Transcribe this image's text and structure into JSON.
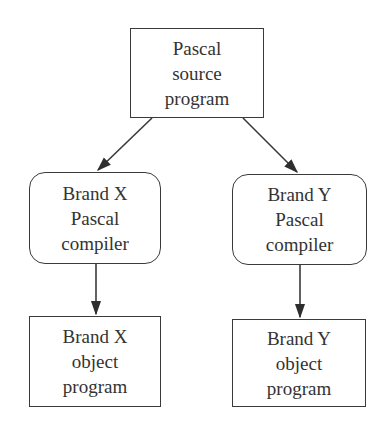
{
  "diagram": {
    "nodes": [
      {
        "id": "source",
        "shape": "rectangle",
        "lines": [
          "Pascal",
          "source",
          "program"
        ]
      },
      {
        "id": "compiler_x",
        "shape": "rounded-rectangle",
        "lines": [
          "Brand X",
          "Pascal",
          "compiler"
        ]
      },
      {
        "id": "compiler_y",
        "shape": "rounded-rectangle",
        "lines": [
          "Brand Y",
          "Pascal",
          "compiler"
        ]
      },
      {
        "id": "object_x",
        "shape": "rectangle",
        "lines": [
          "Brand X",
          "object",
          "program"
        ]
      },
      {
        "id": "object_y",
        "shape": "rectangle",
        "lines": [
          "Brand Y",
          "object",
          "program"
        ]
      }
    ],
    "edges": [
      {
        "from": "source",
        "to": "compiler_x"
      },
      {
        "from": "source",
        "to": "compiler_y"
      },
      {
        "from": "compiler_x",
        "to": "object_x"
      },
      {
        "from": "compiler_y",
        "to": "object_y"
      }
    ],
    "colors": {
      "stroke": "#3a3a3a",
      "text": "#333333",
      "background": "#ffffff"
    }
  }
}
